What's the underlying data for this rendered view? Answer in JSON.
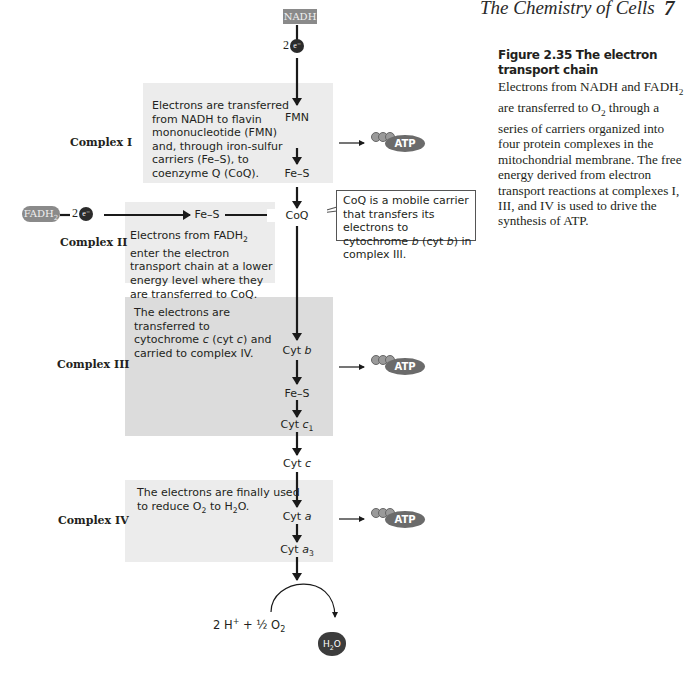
{
  "header": {
    "running_title": "The Chemistry of Cells",
    "page_number": "7"
  },
  "caption": {
    "title": "Figure 2.35  The electron transport chain",
    "text_parts": [
      "Electrons from NADH and FADH",
      "2",
      " are transferred to O",
      "2",
      " through a series of carriers organized into four protein complexes in the mitochondrial membrane. The free energy derived from electron transport reactions at complexes I, III, and IV is used to drive the synthesis of ATP."
    ]
  },
  "sources": {
    "nadh": "NADH",
    "fadh2_base": "FADH",
    "fadh2_sub": "2",
    "two_e_prefix": "2",
    "e_badge": "e⁻"
  },
  "complexes": [
    {
      "label": "Complex I",
      "description": "Electrons are transferred from NADH to flavin mononucleotide (FMN) and, through iron-sulfur carriers (Fe–S), to coenzyme Q (CoQ).",
      "carriers": [
        "FMN",
        "Fe–S"
      ],
      "produces_atp": true
    },
    {
      "label": "Complex II",
      "description_parts": [
        "Electrons from FADH",
        "2",
        " enter the electron transport chain at a lower energy level where they are transferred to CoQ."
      ],
      "carriers": [
        "Fe–S"
      ],
      "produces_atp": false
    },
    {
      "label": "Complex III",
      "description_parts": [
        "The electrons are transferred to cytochrome ",
        "c",
        " (cyt ",
        "c",
        ") and carried to complex IV."
      ],
      "carriers": [
        "Cyt b",
        "Fe–S",
        "Cyt c1"
      ],
      "produces_atp": true
    },
    {
      "label": "Complex IV",
      "description_parts": [
        "The electrons are finally used to reduce O",
        "2",
        " to H",
        "2",
        "O."
      ],
      "carriers": [
        "Cyt a",
        "Cyt a3"
      ],
      "produces_atp": true
    }
  ],
  "mobile_carriers": {
    "coq": "CoQ",
    "cyt_c_base": "Cyt ",
    "cyt_c_italic": "c"
  },
  "carrier_labels": {
    "fmn": "FMN",
    "fes1": "Fe–S",
    "fes2": "Fe–S",
    "fes3": "Fe–S",
    "cytb_base": "Cyt ",
    "cytb_italic": "b",
    "cytc1_base": "Cyt ",
    "cytc1_italic": "c",
    "cytc1_sub": "1",
    "cyta_base": "Cyt ",
    "cyta_italic": "a",
    "cyta3_base": "Cyt ",
    "cyta3_italic": "a",
    "cyta3_sub": "3"
  },
  "callout": {
    "parts": [
      "CoQ is a mobile carrier that transfers its electrons to cytochrome ",
      "b",
      " (cyt ",
      "b",
      ") in complex III."
    ]
  },
  "atp_label": "ATP",
  "final_reaction": {
    "reactants_a": "2 H",
    "reactants_sup": "+",
    "reactants_b": " + ½ O",
    "reactants_sub": "2",
    "product_base": "H",
    "product_sub": "2",
    "product_tail": "O"
  },
  "colors": {
    "box_light": "#ececec",
    "box_dark": "#dcdcdc",
    "pill": "#8a8a8a",
    "atp": "#6b6b6b",
    "arrow": "#1a1a1a"
  }
}
